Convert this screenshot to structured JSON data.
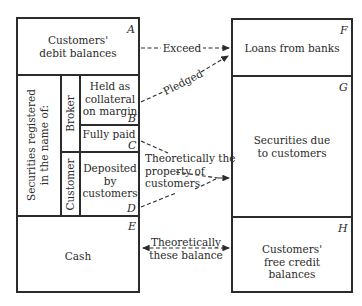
{
  "left_box": {
    "A": {
      "letter": "A",
      "line1": "Customers'",
      "line2": "debit balances"
    },
    "securities_label": {
      "line1": "Securities registered",
      "line2": "in the name of:"
    },
    "broker_label": "Broker",
    "customer_label": "Customer",
    "B": {
      "letter": "B",
      "line1": "Held as",
      "line2": "collateral",
      "line3": "on margin"
    },
    "C": {
      "letter": "C",
      "line1": "Fully paid"
    },
    "D": {
      "letter": "D",
      "line1": "Deposited",
      "line2": "by",
      "line3": "customers"
    },
    "E": {
      "letter": "E",
      "line1": "Cash"
    }
  },
  "right_box": {
    "F": {
      "letter": "F",
      "line1": "Loans from banks"
    },
    "G": {
      "letter": "G",
      "line1": "Securities due",
      "line2": "to customers"
    },
    "H": {
      "letter": "H",
      "line1": "Customers'",
      "line2": "free credit",
      "line3": "balances"
    }
  },
  "arrows": {
    "exceed": "Exceed",
    "pledged": "Pledged",
    "theoretically_property": {
      "line1": "Theoretically the",
      "line2": "property of",
      "line3": "customers"
    },
    "theoretically_balance": {
      "line1": "Theoretically",
      "line2": "these balance"
    }
  },
  "colors": {
    "ink": "#2b2b2b",
    "background": "#ffffff"
  }
}
